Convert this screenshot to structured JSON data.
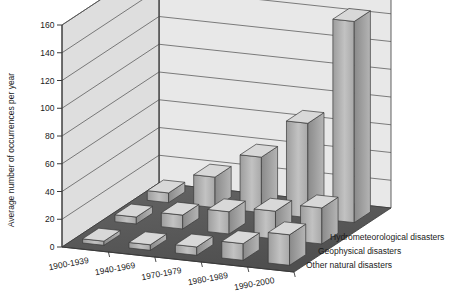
{
  "chart_data": {
    "type": "bar",
    "title": "",
    "subtitle": "",
    "xlabel": "",
    "ylabel": "Average number of occurrences per year",
    "zlabel": "",
    "ylim": [
      0,
      160
    ],
    "ytick_step": 20,
    "yticks": [
      0,
      20,
      40,
      60,
      80,
      100,
      120,
      140,
      160
    ],
    "ytick_labels": [
      "0",
      "20",
      "40",
      "60",
      "80",
      "100",
      "120",
      "140",
      "160"
    ],
    "grid": true,
    "legend_position": "right-floor",
    "projection": "3d-isometric",
    "categories": [
      "1900-1939",
      "1940-1969",
      "1970-1979",
      "1980-1989",
      "1990-2000"
    ],
    "series": [
      {
        "name": "Hydrometeorological disasters",
        "row": "back",
        "values": [
          7,
          22,
          40,
          68,
          145
        ],
        "color": "#b3b3b3"
      },
      {
        "name": "Geophysical disasters",
        "row": "middle",
        "values": [
          5,
          10,
          16,
          20,
          26
        ],
        "color": "#a0a0a0"
      },
      {
        "name": "Other natural disasters",
        "row": "front",
        "values": [
          3,
          4,
          6,
          12,
          22
        ],
        "color": "#9a9a9a"
      }
    ]
  },
  "colors": {
    "back_wall": "#e8e8e8",
    "side_wall": "#dedede",
    "floor": "#5a5a5a",
    "floor_light": "#6a6a6a",
    "bar_front": "#b0b0b0",
    "bar_side": "#8e8e8e",
    "bar_top": "#d8d8d8",
    "grid_line": "#555555",
    "axis_line": "#3a3a3a",
    "text": "#1a1a1a"
  },
  "axis": {
    "y_title": "Average number of occurrences per year"
  },
  "legend": {
    "items": [
      {
        "label": "Hydrometeorological disasters"
      },
      {
        "label": "Geophysical disasters"
      },
      {
        "label": "Other natural disasters"
      }
    ]
  }
}
